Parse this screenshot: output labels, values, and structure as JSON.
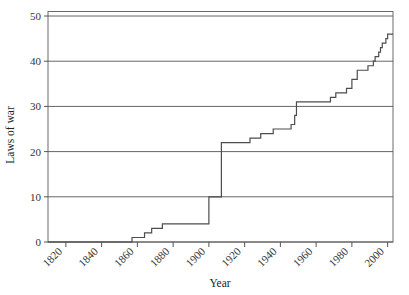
{
  "chart_data": {
    "type": "line",
    "subtype": "step",
    "title": "",
    "xlabel": "Year",
    "ylabel": "Laws of war",
    "xlim": [
      1810,
      2003
    ],
    "ylim": [
      0,
      51
    ],
    "xticks": [
      1820,
      1840,
      1860,
      1880,
      1900,
      1920,
      1940,
      1960,
      1980,
      2000
    ],
    "xtick_labels": [
      "1820",
      "1840",
      "1860",
      "1880",
      "1900",
      "1920",
      "1940",
      "1960",
      "1980",
      "2000"
    ],
    "yticks": [
      0,
      10,
      20,
      30,
      40,
      50
    ],
    "ytick_labels": [
      "0",
      "10",
      "20",
      "30",
      "40",
      "50"
    ],
    "grid": "horizontal",
    "grid_color": "#555555",
    "line_color": "#4d4d4d",
    "line_width": 1.2,
    "background": "#ffffff",
    "series": [
      {
        "name": "Cumulative laws of war",
        "x": [
          1810,
          1856,
          1857,
          1863,
          1864,
          1868,
          1874,
          1899,
          1900,
          1906,
          1907,
          1908,
          1909,
          1922,
          1923,
          1925,
          1929,
          1930,
          1936,
          1938,
          1945,
          1946,
          1947,
          1948,
          1949,
          1954,
          1956,
          1966,
          1968,
          1970,
          1971,
          1972,
          1974,
          1976,
          1977,
          1978,
          1980,
          1981,
          1983,
          1986,
          1989,
          1992,
          1993,
          1995,
          1996,
          1997,
          1998,
          1999,
          2000,
          2003
        ],
        "y": [
          0,
          0,
          1,
          1,
          2,
          3,
          4,
          4,
          10,
          10,
          22,
          22,
          22,
          22,
          23,
          23,
          24,
          24,
          25,
          25,
          25,
          26,
          26,
          28,
          31,
          31,
          31,
          31,
          32,
          32,
          33,
          33,
          33,
          33,
          34,
          34,
          36,
          36,
          38,
          38,
          39,
          40,
          41,
          42,
          43,
          44,
          44,
          45,
          46,
          46
        ]
      }
    ],
    "annotations": []
  }
}
